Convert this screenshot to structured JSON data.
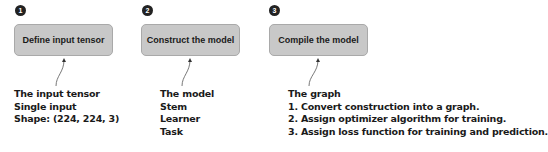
{
  "steps": [
    {
      "number": "1",
      "label": "Define input tensor",
      "note": [
        "The input tensor",
        "Single input",
        "Shape: (224, 224, 3)"
      ]
    },
    {
      "number": "2",
      "label": "Construct the model",
      "note": [
        "The model",
        "Stem",
        "Learner",
        "Task"
      ]
    },
    {
      "number": "3",
      "label": "Compile the model",
      "note": [
        "The graph",
        "1. Convert construction into a graph.",
        "2. Assign optimizer algorithm for training.",
        "3. Assign loss function for training and prediction."
      ]
    }
  ],
  "colors": {
    "box_fill": "#c8c8c8",
    "box_border": "#a9a9a9",
    "badge": "#222222",
    "text": "#1a1a1a"
  }
}
